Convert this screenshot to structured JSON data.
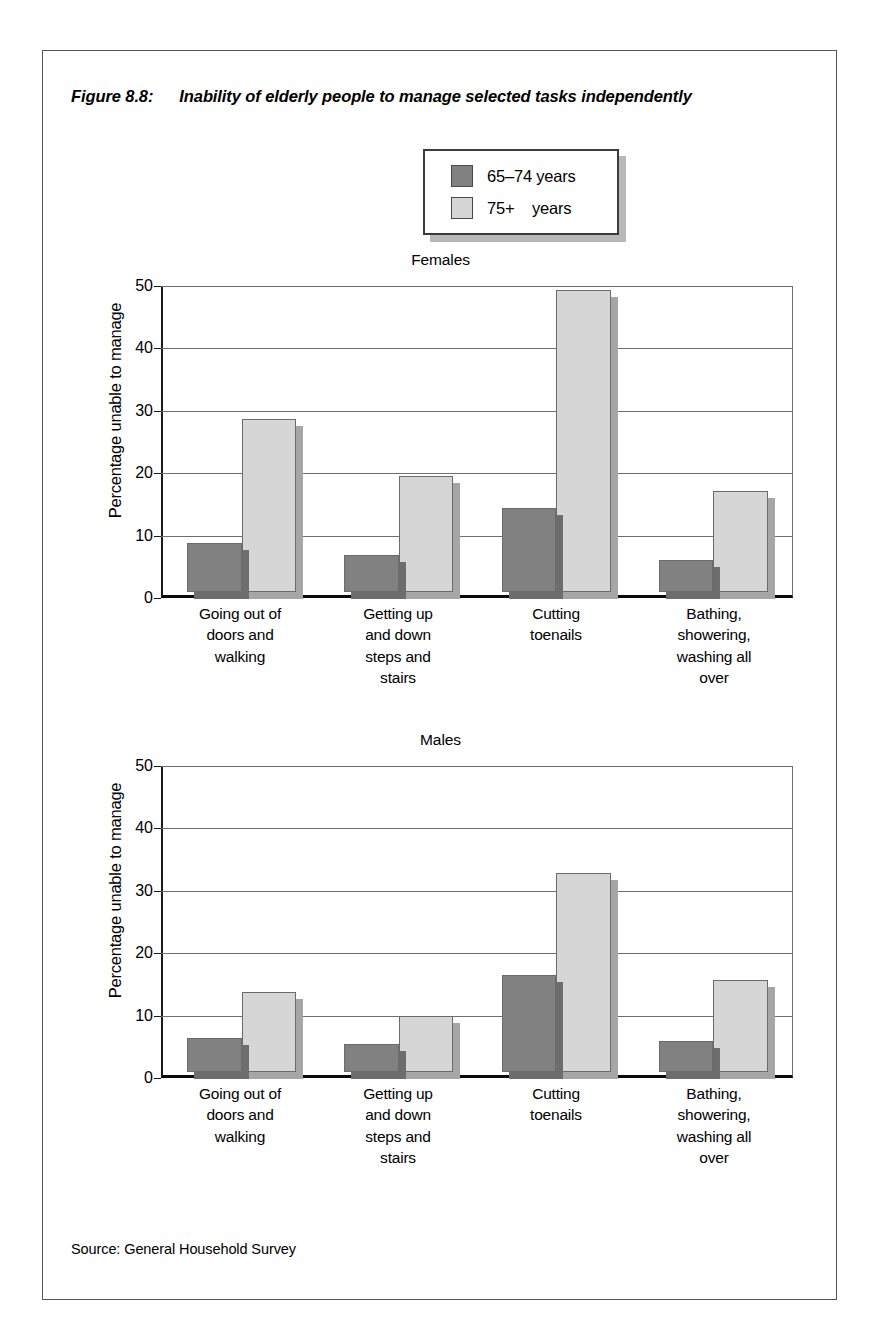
{
  "figure": {
    "number": "Figure 8.8:",
    "title": "Inability of elderly people to manage selected tasks independently",
    "source": "Source: General Household Survey"
  },
  "legend": {
    "items": [
      {
        "label": "65–74 years",
        "color": "#818181",
        "swatch": "dark"
      },
      {
        "label": "75+    years",
        "color": "#d6d6d6",
        "swatch": "light"
      }
    ]
  },
  "axis": {
    "ylabel": "Percentage unable to manage",
    "yticks": [
      "0",
      "10",
      "20",
      "30",
      "40",
      "50"
    ]
  },
  "panels": [
    {
      "title": "Females"
    },
    {
      "title": "Males"
    }
  ],
  "chart_data": [
    {
      "type": "bar",
      "title": "Females",
      "categories": [
        "Going out of\ndoors and\nwalking",
        "Getting up\nand down\nsteps and\nstairs",
        "Cutting\ntoenails",
        "Bathing,\nshowering,\nwashing all\nover"
      ],
      "series": [
        {
          "name": "65–74 years",
          "values": [
            8.0,
            6.0,
            13.8,
            5.2
          ],
          "color": "#818181"
        },
        {
          "name": "75+ years",
          "values": [
            28.3,
            19.0,
            49.3,
            16.5
          ],
          "color": "#d6d6d6"
        }
      ],
      "xlabel": "",
      "ylabel": "Percentage unable to manage",
      "ylim": [
        0,
        50
      ],
      "ytick_step": 10,
      "grid": true,
      "legend_position": "top-center"
    },
    {
      "type": "bar",
      "title": "Males",
      "categories": [
        "Going out of\ndoors and\nwalking",
        "Getting up\nand down\nsteps and\nstairs",
        "Cutting\ntoenails",
        "Bathing,\nshowering,\nwashing all\nover"
      ],
      "series": [
        {
          "name": "65–74 years",
          "values": [
            5.6,
            4.6,
            15.8,
            5.1
          ],
          "color": "#818181"
        },
        {
          "name": "75+ years",
          "values": [
            13.0,
            9.2,
            32.5,
            15.1
          ],
          "color": "#d6d6d6"
        }
      ],
      "xlabel": "",
      "ylabel": "Percentage unable to manage",
      "ylim": [
        0,
        50
      ],
      "ytick_step": 10,
      "grid": true,
      "legend_position": "top-center"
    }
  ]
}
